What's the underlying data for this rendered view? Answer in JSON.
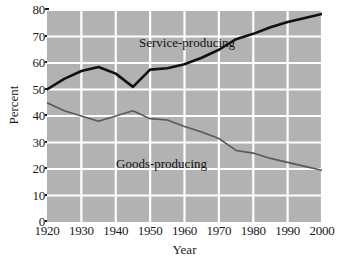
{
  "chart_data": {
    "type": "line",
    "title": "",
    "subtitle": "",
    "xlabel": "Year",
    "ylabel": "Percent",
    "xlim": [
      1920,
      2000
    ],
    "ylim": [
      0,
      80
    ],
    "grid": true,
    "legend_position": "inline-annotation",
    "x_ticks": [
      1920,
      1930,
      1940,
      1950,
      1960,
      1970,
      1980,
      1990,
      2000
    ],
    "y_ticks": [
      0,
      10,
      20,
      30,
      40,
      50,
      60,
      70,
      80
    ],
    "x": [
      1920,
      1925,
      1930,
      1935,
      1940,
      1945,
      1950,
      1955,
      1960,
      1965,
      1970,
      1975,
      1980,
      1985,
      1990,
      1995,
      2000
    ],
    "series": [
      {
        "name": "Service-producing",
        "color": "#111111",
        "width": 2.6,
        "values": [
          50,
          54,
          57,
          58.5,
          56,
          51,
          57.5,
          58,
          59.5,
          62,
          65,
          69,
          71,
          73.5,
          75.5,
          77,
          78.5
        ]
      },
      {
        "name": "Goods-producing",
        "color": "#595959",
        "width": 1.6,
        "values": [
          45,
          42,
          40,
          38,
          40,
          42,
          39,
          38.5,
          36,
          34,
          31.5,
          27,
          26,
          24,
          22.5,
          21,
          19.5
        ]
      }
    ],
    "annotations": [
      {
        "text": "Service-producing",
        "x": 1952,
        "y": 72
      },
      {
        "text": "Goods-producing",
        "x": 1945,
        "y": 25
      }
    ],
    "colors": {
      "plot_background": "#b2b2b2",
      "gridline": "#ffffff",
      "page_background": "#ffffff",
      "text": "#1a1a1a",
      "service_line": "#111111",
      "goods_line": "#595959"
    }
  }
}
